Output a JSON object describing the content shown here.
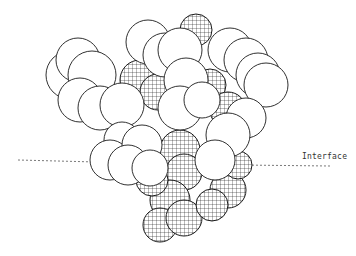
{
  "figure": {
    "width": 356,
    "height": 256,
    "background": "#ffffff",
    "stroke_color": "#1a1a1a",
    "interface_label": "Interface",
    "interface_line": {
      "left": {
        "x1": 18,
        "y1": 160,
        "x2": 96,
        "y2": 162
      },
      "right": {
        "x1": 240,
        "y1": 165,
        "x2": 330,
        "y2": 166
      }
    },
    "label_position": {
      "x": 302,
      "y": 152
    }
  },
  "molecule": {
    "description": "Space-filling atomic model; plain spheres above, hatched (mesh) spheres predominantly below interface",
    "mesh_spheres": [
      {
        "cx": 196,
        "cy": 30,
        "r": 16
      },
      {
        "cx": 140,
        "cy": 80,
        "r": 20
      },
      {
        "cx": 158,
        "cy": 92,
        "r": 18
      },
      {
        "cx": 210,
        "cy": 85,
        "r": 16
      },
      {
        "cx": 228,
        "cy": 110,
        "r": 18
      },
      {
        "cx": 180,
        "cy": 150,
        "r": 20
      },
      {
        "cx": 184,
        "cy": 172,
        "r": 18
      },
      {
        "cx": 170,
        "cy": 200,
        "r": 20
      },
      {
        "cx": 160,
        "cy": 225,
        "r": 17
      },
      {
        "cx": 184,
        "cy": 218,
        "r": 18
      },
      {
        "cx": 228,
        "cy": 190,
        "r": 18
      },
      {
        "cx": 212,
        "cy": 205,
        "r": 16
      },
      {
        "cx": 152,
        "cy": 180,
        "r": 16
      },
      {
        "cx": 238,
        "cy": 165,
        "r": 14
      }
    ],
    "plain_spheres": [
      {
        "cx": 70,
        "cy": 75,
        "r": 24
      },
      {
        "cx": 78,
        "cy": 60,
        "r": 22
      },
      {
        "cx": 92,
        "cy": 75,
        "r": 24
      },
      {
        "cx": 80,
        "cy": 100,
        "r": 22
      },
      {
        "cx": 100,
        "cy": 108,
        "r": 22
      },
      {
        "cx": 148,
        "cy": 42,
        "r": 22
      },
      {
        "cx": 165,
        "cy": 55,
        "r": 22
      },
      {
        "cx": 180,
        "cy": 50,
        "r": 22
      },
      {
        "cx": 230,
        "cy": 50,
        "r": 22
      },
      {
        "cx": 246,
        "cy": 60,
        "r": 22
      },
      {
        "cx": 258,
        "cy": 75,
        "r": 22
      },
      {
        "cx": 266,
        "cy": 85,
        "r": 22
      },
      {
        "cx": 122,
        "cy": 105,
        "r": 22
      },
      {
        "cx": 186,
        "cy": 80,
        "r": 22
      },
      {
        "cx": 180,
        "cy": 108,
        "r": 22
      },
      {
        "cx": 246,
        "cy": 118,
        "r": 20
      },
      {
        "cx": 228,
        "cy": 135,
        "r": 22
      },
      {
        "cx": 122,
        "cy": 140,
        "r": 18
      },
      {
        "cx": 110,
        "cy": 160,
        "r": 20
      },
      {
        "cx": 142,
        "cy": 145,
        "r": 20
      },
      {
        "cx": 128,
        "cy": 165,
        "r": 20
      },
      {
        "cx": 150,
        "cy": 168,
        "r": 18
      },
      {
        "cx": 215,
        "cy": 160,
        "r": 20
      },
      {
        "cx": 202,
        "cy": 100,
        "r": 18
      }
    ]
  }
}
